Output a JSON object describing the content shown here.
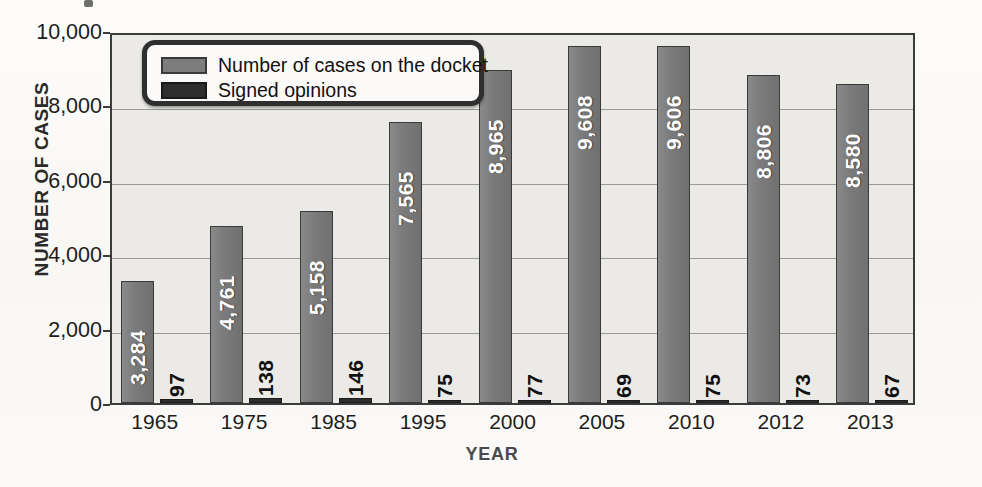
{
  "chart_data": {
    "type": "bar",
    "title": "",
    "xlabel": "YEAR",
    "ylabel": "NUMBER OF CASES",
    "ylim": [
      0,
      10000
    ],
    "yticks": [
      "0",
      "2,000",
      "4,000",
      "6,000",
      "8,000",
      "10,000"
    ],
    "ytick_values": [
      0,
      2000,
      4000,
      6000,
      8000,
      10000
    ],
    "grid": true,
    "legend_position": "top-left",
    "categories": [
      "1965",
      "1975",
      "1985",
      "1995",
      "2000",
      "2005",
      "2010",
      "2012",
      "2013"
    ],
    "series": [
      {
        "name": "Number of cases on the docket",
        "color": "#7d7d7d",
        "values": [
          3284,
          4761,
          5158,
          7565,
          8965,
          9608,
          9606,
          8806,
          8580
        ],
        "labels": [
          "3,284",
          "4,761",
          "5,158",
          "7,565",
          "8,965",
          "9,608",
          "9,606",
          "8,806",
          "8,580"
        ]
      },
      {
        "name": "Signed opinions",
        "color": "#2e2e2e",
        "values": [
          97,
          138,
          146,
          75,
          77,
          69,
          75,
          73,
          67
        ],
        "labels": [
          "97",
          "138",
          "146",
          "75",
          "77",
          "69",
          "75",
          "73",
          "67"
        ]
      }
    ]
  },
  "legend": {
    "items": [
      {
        "label": "Number of cases on the docket",
        "swatch": "docket"
      },
      {
        "label": "Signed opinions",
        "swatch": "signed"
      }
    ]
  },
  "axes": {
    "y_title": "NUMBER OF CASES",
    "x_title": "YEAR"
  }
}
